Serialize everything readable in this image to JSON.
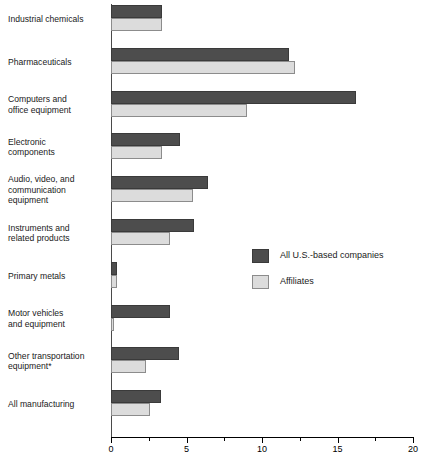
{
  "chart_data": {
    "type": "bar",
    "orientation": "horizontal",
    "title": "",
    "xlabel": "",
    "ylabel": "",
    "xlim": [
      0,
      20
    ],
    "xticks": [
      0,
      5,
      10,
      15,
      20
    ],
    "xtick_labels": [
      "0",
      "5",
      "10",
      "15",
      "20"
    ],
    "minor_tick_step": 2.5,
    "grid": false,
    "legend_position": "center-right",
    "categories": [
      "Industrial chemicals",
      "Pharmaceuticals",
      "Computers and\noffice equipment",
      "Electronic\ncomponents",
      "Audio, video, and\ncommunication\nequipment",
      "Instruments and\nrelated products",
      "Primary metals",
      "Motor vehicles\nand equipment",
      "Other transportation\nequipment*",
      "All manufacturing"
    ],
    "series": [
      {
        "name": "All U.S.-based companies",
        "color": "#4d4d4d",
        "values": [
          3.4,
          11.8,
          16.2,
          4.6,
          6.4,
          5.5,
          0.4,
          3.9,
          4.5,
          3.3
        ]
      },
      {
        "name": "Affiliates",
        "color": "#dcdcdc",
        "values": [
          3.4,
          12.2,
          9.0,
          3.4,
          5.4,
          3.9,
          0.4,
          0.2,
          2.3,
          2.6
        ]
      }
    ]
  },
  "legend": {
    "items": [
      {
        "label": "All U.S.-based companies",
        "swatch": "dark"
      },
      {
        "label": "Affiliates",
        "swatch": "light"
      }
    ]
  },
  "footnote": ""
}
